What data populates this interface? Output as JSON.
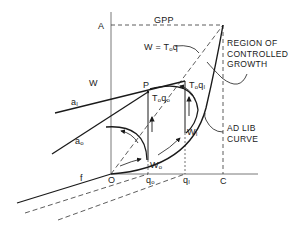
{
  "diagram": {
    "type": "growth-curve-diagram",
    "axes": {
      "vertical_label": "W",
      "top_label": "A",
      "origin_label": "O"
    },
    "gpp_label": "GPP",
    "equation": {
      "W": "W",
      "eq": "=",
      "T": "T",
      "sub": "o",
      "q": "q"
    },
    "region_note": [
      "REGION OF",
      "CONTROLLED",
      "GROWTH"
    ],
    "adlib_note": [
      "AD LIB",
      "CURVE"
    ],
    "line_labels": {
      "a1": "a",
      "a1_sub": "I",
      "a0": "a",
      "a0_sub": "o",
      "f": "f"
    },
    "point_P": "P",
    "t0q1": {
      "T": "T",
      "sub": "o",
      "q": "q",
      "qsub": "I"
    },
    "t0q0": {
      "T": "T",
      "sub": "o",
      "q": "q",
      "qsub": "o"
    },
    "W1": {
      "W": "W",
      "sub": "I"
    },
    "W0": {
      "W": "W",
      "sub": "o"
    },
    "x_ticks": [
      {
        "q": "q",
        "sub": "o"
      },
      {
        "q": "q",
        "sub": "I"
      },
      {
        "label": "C"
      }
    ],
    "colors": {
      "ink": "#1a1a1a",
      "background": "#ffffff"
    }
  }
}
